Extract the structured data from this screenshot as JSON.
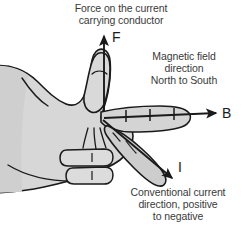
{
  "diagram": {
    "title_force": "Force on the current\ncarrying conductor",
    "force_caption_line1": "Force on the current",
    "force_caption_line2": "carrying conductor",
    "field_caption_line1": "Magnetic field",
    "field_caption_line2": "direction",
    "field_caption_line3": "North to South",
    "current_caption_line1": "Conventional current",
    "current_caption_line2": "direction, positive",
    "current_caption_line3": "to negative",
    "vector_labels": {
      "force": "F",
      "field": "B",
      "current": "I"
    },
    "icons": {
      "hand": "left-hand-icon",
      "force_arrow": "up-arrow-icon",
      "field_arrow": "right-arrow-icon",
      "current_arrow": "diagonal-down-right-arrow-icon",
      "field_ticks": "field-line-tick-icon"
    },
    "colors": {
      "background": "#ffffff",
      "hand_fill": "#d7d7d7",
      "hand_fill_shadow": "#c2c2c2",
      "outline": "#1a1a1a",
      "caption_text": "#3a3a3a",
      "vector_text": "#1a1a1a"
    }
  }
}
